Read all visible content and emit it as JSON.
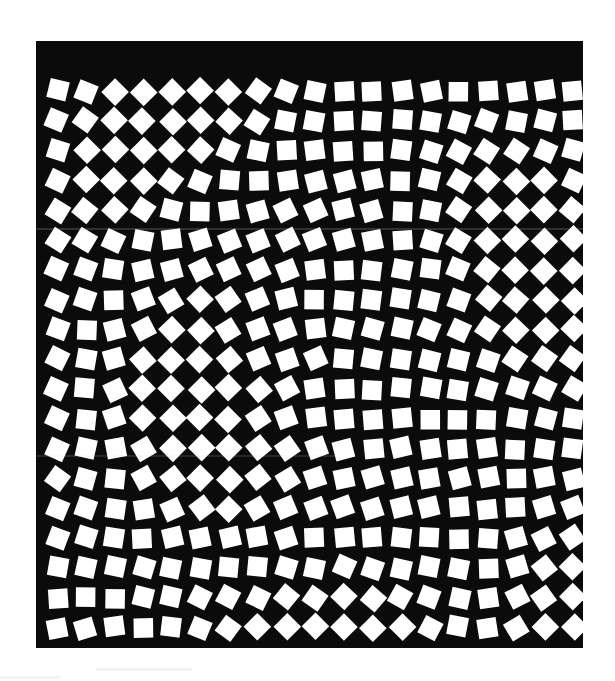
{
  "figure": {
    "background_color": "#ffffff",
    "panel_color": "#0b0b0b",
    "tile_color": "#ffffff",
    "panel": {
      "x": 36,
      "y": 41,
      "width": 547,
      "height": 607
    },
    "grid": {
      "columns": 19,
      "rows": 19,
      "origin_x": 57,
      "origin_y": 91,
      "step_x": 28.7,
      "step_y": 29.8,
      "tile_size": 19.5
    },
    "rotation_field": {
      "description": "angle(deg) = A1*sin(2*pi*(u*f1x + v*f1y) + p1) + A2*sin(2*pi*(u*f2x + v*f2y) + p2) + A3*sin(2*pi*r*f3 + p3), with u,v normalized 0..1 across the grid and r the radius from centre",
      "max_abs_angle": 45,
      "components": [
        {
          "amplitude": 26,
          "fx": 1.15,
          "fy": 0.55,
          "phase": 0.35
        },
        {
          "amplitude": 22,
          "fx": -0.48,
          "fy": 1.05,
          "phase": 1.95
        },
        {
          "amplitude": 17,
          "radial_frequency": 1.6,
          "phase": 0.6
        }
      ],
      "seed": 20240617,
      "jitter_degrees": 7,
      "position_jitter_px": 1.4
    },
    "smudges": [
      {
        "x": 36,
        "y": 228,
        "width": 547,
        "height": 2,
        "opacity": 0.18
      },
      {
        "x": 36,
        "y": 455,
        "width": 300,
        "height": 2,
        "opacity": 0.14
      },
      {
        "x": 96,
        "y": 668,
        "width": 96,
        "height": 3,
        "opacity": 0.35
      },
      {
        "x": 0,
        "y": 676,
        "width": 60,
        "height": 3,
        "opacity": 0.3
      }
    ]
  },
  "chart_data": {
    "type": "heatmap",
    "xlabel": "",
    "ylabel": "",
    "columns": 19,
    "rows": 19,
    "value_name": "tile rotation (degrees)",
    "vmin": -45,
    "vmax": 45,
    "legend": "none",
    "grid": false
  }
}
